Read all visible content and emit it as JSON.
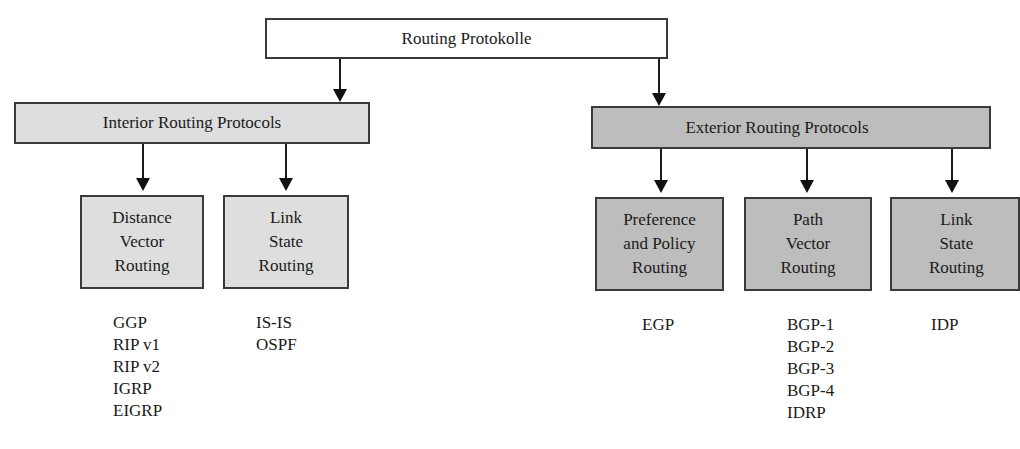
{
  "title": "Routing Protokolle",
  "colors": {
    "root_fill": "#ffffff",
    "interior_fill": "#dedede",
    "exterior_fill": "#bdbdbd",
    "border": "#3a3a3a"
  },
  "interior": {
    "label": "Interior Routing Protocols",
    "children": [
      {
        "label": "Distance\nVector\nRouting",
        "protocols": [
          "GGP",
          "RIP v1",
          "RIP v2",
          "IGRP",
          "EIGRP"
        ]
      },
      {
        "label": "Link\nState\nRouting",
        "protocols": [
          "IS-IS",
          "OSPF"
        ]
      }
    ]
  },
  "exterior": {
    "label": "Exterior Routing Protocols",
    "children": [
      {
        "label": "Preference\nand Policy\nRouting",
        "protocols": [
          "EGP"
        ]
      },
      {
        "label": "Path\nVector\nRouting",
        "protocols": [
          "BGP-1",
          "BGP-2",
          "BGP-3",
          "BGP-4",
          "IDRP"
        ]
      },
      {
        "label": "Link\nState\nRouting",
        "protocols": [
          "IDP"
        ]
      }
    ]
  }
}
